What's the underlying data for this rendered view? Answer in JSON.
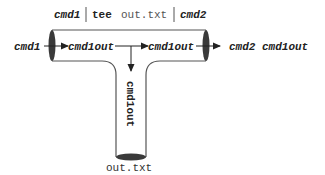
{
  "title": {
    "cmd1": "cmd1",
    "sep1": "|",
    "tee": "tee",
    "file": "out.txt",
    "sep2": "|",
    "cmd2": "cmd2"
  },
  "pipe": {
    "input_label": "cmd1",
    "inner_left_label": "cmd1out",
    "inner_right_label": "cmd1out",
    "output_label": "cmd2 cmd1out",
    "stem_label": "cmd1out",
    "file_label": "out.txt"
  },
  "colors": {
    "stroke": "#555555",
    "cap": "#3a3a3a",
    "text": "#222222"
  }
}
